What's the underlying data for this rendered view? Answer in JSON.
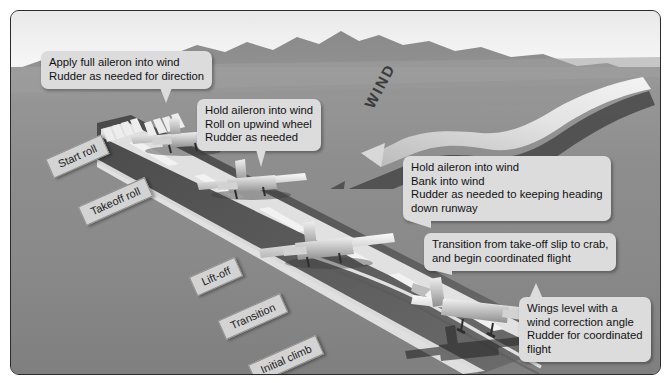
{
  "figure": {
    "background_color": "#8d8d8d",
    "sky_color": "#f4f4f4",
    "callout_color": "#dcdcdc",
    "plate_color": "#d3d3d3"
  },
  "wind": {
    "label": "WIND",
    "direction": "from upper-right toward lower-left across the runway"
  },
  "callouts": [
    {
      "id": "start-roll",
      "lines": [
        "Apply full aileron into wind",
        "Rudder as needed for direction"
      ]
    },
    {
      "id": "takeoff-roll",
      "lines": [
        "Hold aileron into wind",
        "Roll on upwind wheel",
        "Rudder as needed"
      ]
    },
    {
      "id": "lift-off",
      "lines": [
        "Hold aileron into wind",
        "Bank into wind",
        "Rudder as needed to keeping heading",
        "down runway"
      ]
    },
    {
      "id": "transition",
      "lines": [
        "Transition from take-off slip to crab,",
        "and begin coordinated flight"
      ]
    },
    {
      "id": "initial-climb",
      "lines": [
        "Wings level with a",
        "wind correction angle",
        "Rudder for coordinated",
        "flight"
      ]
    }
  ],
  "phases": [
    {
      "id": "start-roll",
      "label": "Start roll"
    },
    {
      "id": "takeoff-roll",
      "label": "Takeoff roll"
    },
    {
      "id": "lift-off",
      "label": "Lift-off"
    },
    {
      "id": "transition",
      "label": "Transition"
    },
    {
      "id": "initial-climb",
      "label": "Initial climb"
    }
  ],
  "aircraft": [
    {
      "id": "aircraft-1",
      "phase": "Start roll",
      "state": "on runway, full aileron into wind"
    },
    {
      "id": "aircraft-2",
      "phase": "Takeoff roll",
      "state": "on runway, rolling on upwind wheel"
    },
    {
      "id": "aircraft-3",
      "phase": "Lift-off",
      "state": "lifting off, banked into wind"
    },
    {
      "id": "aircraft-4",
      "phase": "Initial climb",
      "state": "airborne, wings level, crabbing"
    }
  ]
}
